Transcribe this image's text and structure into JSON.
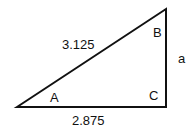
{
  "diagram": {
    "type": "right-triangle",
    "hypotenuse_label": "3.125",
    "base_label": "2.875",
    "side_label": "a",
    "angles": {
      "A": "A",
      "B": "B",
      "C": "C"
    },
    "line_color": "#111111"
  }
}
